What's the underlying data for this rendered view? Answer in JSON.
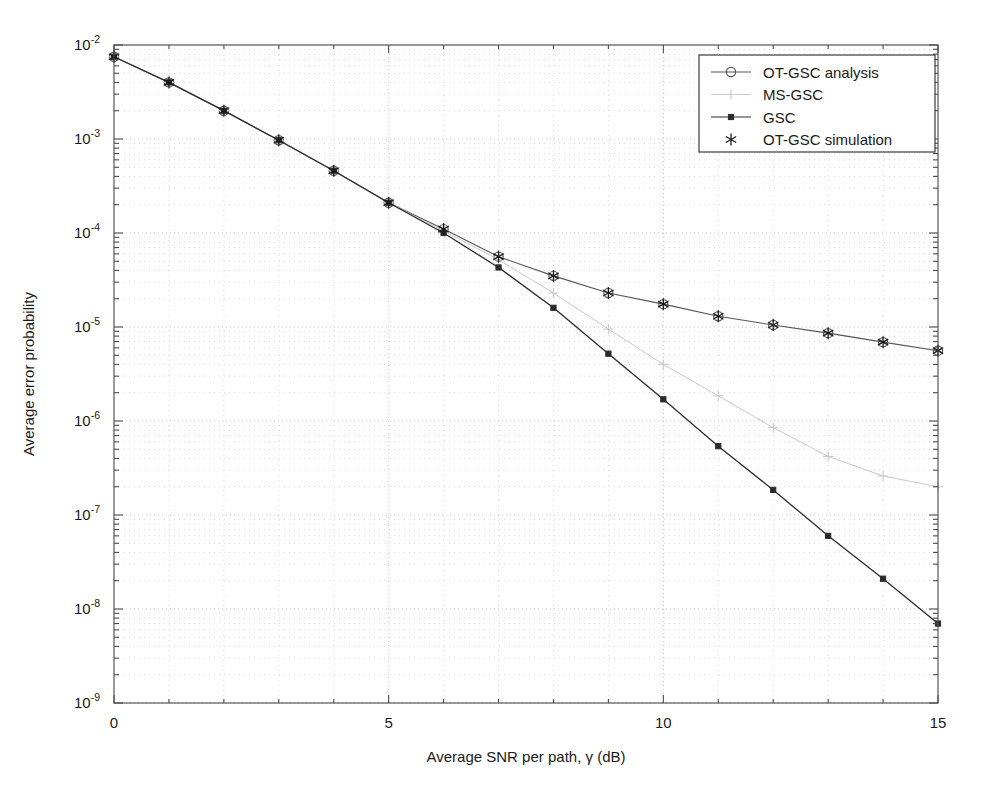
{
  "chart_data": {
    "type": "line",
    "title": "",
    "xlabel": "Average SNR per path, γ (dB)",
    "ylabel": "Average error probability",
    "xlim": [
      0,
      15
    ],
    "ylim": [
      1e-09,
      0.01
    ],
    "yscale": "log",
    "grid": true,
    "grid_style": "dotted",
    "legend_position": "top-right",
    "x_ticks": [
      0,
      5,
      10,
      15
    ],
    "x_tick_labels": [
      "0",
      "5",
      "10",
      "15"
    ],
    "y_ticks": [
      0.01,
      0.001,
      0.0001,
      1e-05,
      1e-06,
      1e-07,
      1e-08,
      1e-09
    ],
    "y_tick_labels": [
      "10^-2",
      "10^-3",
      "10^-4",
      "10^-5",
      "10^-6",
      "10^-7",
      "10^-8",
      "10^-9"
    ],
    "y_tick_mantissa": "10",
    "y_tick_exponents": [
      "-2",
      "-3",
      "-4",
      "-5",
      "-6",
      "-7",
      "-8",
      "-9"
    ],
    "x": [
      0,
      1,
      2,
      3,
      4,
      5,
      6,
      7,
      8,
      9,
      10,
      11,
      12,
      13,
      14,
      15
    ],
    "series": [
      {
        "name": "OT-GSC analysis",
        "marker": "circle",
        "color": "#555555",
        "linewidth": 1.1,
        "values": [
          0.0075,
          0.004,
          0.002,
          0.00097,
          0.00046,
          0.00021,
          0.00011,
          5.6e-05,
          3.5e-05,
          2.3e-05,
          1.75e-05,
          1.3e-05,
          1.05e-05,
          8.6e-06,
          6.9e-06,
          5.6e-06
        ]
      },
      {
        "name": "MS-GSC",
        "marker": "plus",
        "color": "#c9c9c9",
        "linewidth": 1.0,
        "values": [
          0.0075,
          0.004,
          0.002,
          0.00097,
          0.00046,
          0.00021,
          0.000105,
          5.2e-05,
          2.3e-05,
          9.5e-06,
          4e-06,
          1.85e-06,
          8.5e-07,
          4.2e-07,
          2.6e-07,
          2e-07
        ]
      },
      {
        "name": "GSC",
        "marker": "square",
        "color": "#2a2a2a",
        "linewidth": 1.3,
        "values": [
          0.0075,
          0.004,
          0.002,
          0.00097,
          0.00046,
          0.00021,
          0.0001,
          4.3e-05,
          1.6e-05,
          5.2e-06,
          1.7e-06,
          5.4e-07,
          1.85e-07,
          6e-08,
          2.1e-08,
          7e-09
        ]
      },
      {
        "name": "OT-GSC simulation",
        "marker": "asterisk",
        "color": "#1a1a1a",
        "linewidth": 0,
        "values": [
          0.0075,
          0.004,
          0.002,
          0.00097,
          0.00046,
          0.00021,
          0.00011,
          5.6e-05,
          3.5e-05,
          2.3e-05,
          1.75e-05,
          1.3e-05,
          1.05e-05,
          8.6e-06,
          6.9e-06,
          5.6e-06
        ]
      }
    ]
  },
  "legend": {
    "entries": [
      {
        "label": "OT-GSC analysis",
        "marker": "circle",
        "color": "#555555"
      },
      {
        "label": "MS-GSC",
        "marker": "plus",
        "color": "#c9c9c9"
      },
      {
        "label": "GSC",
        "marker": "square",
        "color": "#2a2a2a"
      },
      {
        "label": "OT-GSC simulation",
        "marker": "asterisk",
        "color": "#1a1a1a"
      }
    ]
  },
  "colors": {
    "axis": "#4a4a4a",
    "grid": "#b8b8b8",
    "background": "#ffffff",
    "text": "#1a1a1a"
  }
}
